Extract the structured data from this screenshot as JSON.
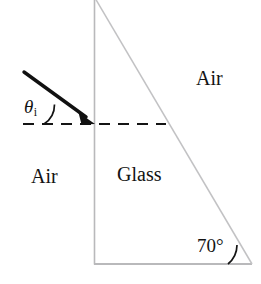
{
  "figure": {
    "background_color": "#ffffff",
    "width": 261,
    "height": 284,
    "labels": {
      "air_top": "Air",
      "air_left": "Air",
      "glass": "Glass",
      "theta_symbol": "θ",
      "theta_subscript": "i",
      "apex_angle": "70°"
    },
    "colors": {
      "prism_outline": "#b9b9bb",
      "ray": "#111111",
      "normal_dashed": "#141414",
      "text": "#131313",
      "arc": "#141414"
    },
    "geometry": {
      "prism_apex": [
        95,
        -1
      ],
      "prism_bottom_left": [
        94,
        264
      ],
      "prism_bottom_right": [
        252,
        264
      ],
      "ray_start": [
        24,
        72
      ],
      "ray_end": [
        95,
        124
      ],
      "normal_line_start": [
        23,
        124
      ],
      "normal_line_end": [
        166,
        124
      ],
      "incidence_point": [
        95,
        124
      ]
    }
  }
}
